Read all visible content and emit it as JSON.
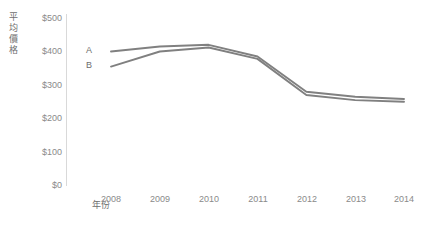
{
  "chart_data": {
    "type": "line",
    "title": "",
    "xlabel": "年份",
    "ylabel": "平均價格",
    "x": [
      "2008",
      "2009",
      "2010",
      "2011",
      "2012",
      "2013",
      "2014"
    ],
    "categories": [
      "2008",
      "2009",
      "2010",
      "2011",
      "2012",
      "2013",
      "2014"
    ],
    "series": [
      {
        "name": "A",
        "values": [
          400,
          415,
          420,
          385,
          280,
          265,
          258
        ],
        "color": "#808080"
      },
      {
        "name": "B",
        "values": [
          355,
          400,
          412,
          378,
          270,
          255,
          250
        ],
        "color": "#808080"
      }
    ],
    "ylim": [
      0,
      500
    ],
    "yticks": [
      0,
      100,
      200,
      300,
      400,
      500
    ],
    "ytick_labels": [
      "$0",
      "$100",
      "$200",
      "$300",
      "$400",
      "$500"
    ],
    "grid": false,
    "legend": "inline-left",
    "axis_color": "#d9d9d9",
    "tick_text_color": "#8a8a8a",
    "background": "#ffffff"
  },
  "axis": {
    "y_title": "平均價格",
    "x_title": "年份"
  },
  "yticks": {
    "t0": "$0",
    "t1": "$100",
    "t2": "$200",
    "t3": "$300",
    "t4": "$400",
    "t5": "$500"
  },
  "xticks": {
    "t0": "2008",
    "t1": "2009",
    "t2": "2010",
    "t3": "2011",
    "t4": "2012",
    "t5": "2013",
    "t6": "2014"
  },
  "series_labels": {
    "a": "A",
    "b": "B"
  }
}
